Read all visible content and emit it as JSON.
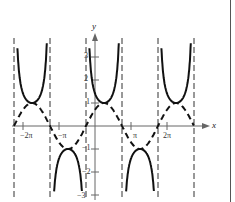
{
  "chart_data": {
    "type": "line",
    "title": "",
    "xlabel": "x",
    "ylabel": "y",
    "series": [
      {
        "name": "y = csc(x + π/4)",
        "style": "solid",
        "description": "cosecant branches, alternating U (min 1) and ∩ (max -1)"
      },
      {
        "name": "y = sin(x + π/4)",
        "style": "dashed",
        "description": "reciprocal sine wave, amplitude 1"
      }
    ],
    "asymptotes_x": [
      "-9π/4",
      "-5π/4",
      "-π/4",
      "3π/4",
      "7π/4",
      "11π/4"
    ],
    "xticks": [
      {
        "value": "-2π",
        "label": "−2π"
      },
      {
        "value": "-π",
        "label": "−π"
      },
      {
        "value": "π",
        "label": "π"
      },
      {
        "value": "2π",
        "label": "2π"
      }
    ],
    "yticks": [
      {
        "value": 3,
        "label": "3"
      },
      {
        "value": 2,
        "label": "2"
      },
      {
        "value": 1,
        "label": "1"
      },
      {
        "value": -1,
        "label": "−1"
      },
      {
        "value": -2,
        "label": "−2"
      },
      {
        "value": -3,
        "label": "−3"
      }
    ],
    "xlim": [
      "-2.3π",
      "2.8π"
    ],
    "ylim": [
      -3,
      3.5
    ],
    "grid": false,
    "legend": "none"
  },
  "axes": {
    "x_label": "x",
    "y_label": "y"
  }
}
